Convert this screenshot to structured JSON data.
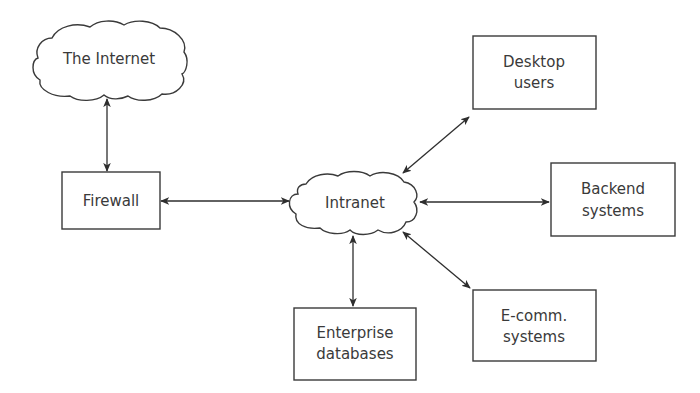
{
  "diagram": {
    "type": "network-topology",
    "colors": {
      "stroke": "#3a3a3a",
      "text": "#3a3a3a",
      "background": "#ffffff"
    },
    "nodes": {
      "internet": {
        "shape": "cloud",
        "lines": [
          "The Internet"
        ]
      },
      "firewall": {
        "shape": "box",
        "lines": [
          "Firewall"
        ]
      },
      "intranet": {
        "shape": "cloud",
        "lines": [
          "Intranet"
        ]
      },
      "desktop": {
        "shape": "box",
        "lines": [
          "Desktop",
          "users"
        ]
      },
      "backend": {
        "shape": "box",
        "lines": [
          "Backend",
          "systems"
        ]
      },
      "ecomm": {
        "shape": "box",
        "lines": [
          "E-comm.",
          "systems"
        ]
      },
      "enterprise": {
        "shape": "box",
        "lines": [
          "Enterprise",
          "databases"
        ]
      }
    },
    "edges": [
      {
        "from": "internet",
        "to": "firewall",
        "direction": "bidirectional"
      },
      {
        "from": "firewall",
        "to": "intranet",
        "direction": "bidirectional"
      },
      {
        "from": "intranet",
        "to": "desktop",
        "direction": "bidirectional"
      },
      {
        "from": "intranet",
        "to": "backend",
        "direction": "bidirectional"
      },
      {
        "from": "intranet",
        "to": "ecomm",
        "direction": "bidirectional"
      },
      {
        "from": "intranet",
        "to": "enterprise",
        "direction": "bidirectional"
      }
    ]
  }
}
